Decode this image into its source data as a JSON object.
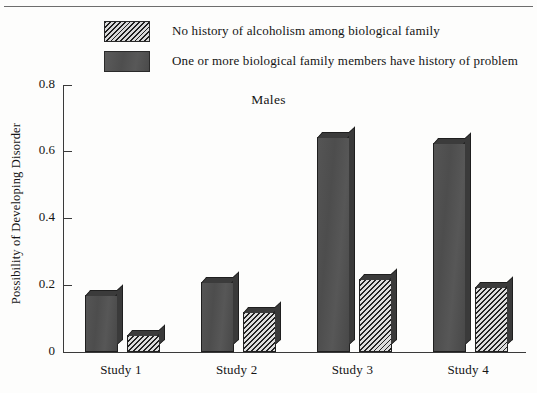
{
  "chart_data": {
    "type": "bar",
    "title": "Males",
    "xlabel": "",
    "ylabel": "Possibility of Developing Disorder",
    "categories": [
      "Study 1",
      "Study 2",
      "Study 3",
      "Study 4"
    ],
    "ylim": [
      0,
      0.8
    ],
    "ytick_labels": [
      "0",
      "0.2",
      "0.4",
      "0.6",
      "0.8"
    ],
    "ytick_values": [
      0,
      0.2,
      0.4,
      0.6,
      0.8
    ],
    "grid": false,
    "legend_position": "top",
    "series": [
      {
        "name": "No history of alcoholism among biological family",
        "swatch": "hatch",
        "values": [
          0.05,
          0.12,
          0.22,
          0.195
        ]
      },
      {
        "name": "One or more biological family members have history of problem",
        "swatch": "solid",
        "values": [
          0.17,
          0.21,
          0.645,
          0.625
        ]
      }
    ],
    "bar_order_in_group": [
      "solid",
      "hatch"
    ]
  },
  "legend": {
    "items": [
      {
        "label": "No history of alcoholism among biological family",
        "swatch": "hatch"
      },
      {
        "label": "One or more biological family members have history of problem",
        "swatch": "solid"
      }
    ]
  },
  "axes": {
    "y_title": "Possibility of Developing Disorder",
    "y_ticks": [
      "0.8",
      "0.6",
      "0.4",
      "0.2",
      "0"
    ],
    "x_ticks": [
      "Study 1",
      "Study 2",
      "Study 3",
      "Study 4"
    ]
  },
  "colors": {
    "solid_bar": "#4d4d4d",
    "hatch_line": "#222222",
    "hatch_bg": "#dcdcdc",
    "axis": "#3a3a3a",
    "text": "#141414",
    "background": "#fdfdfc"
  }
}
